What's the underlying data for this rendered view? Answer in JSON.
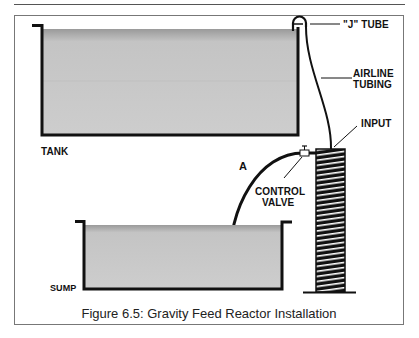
{
  "figure": {
    "caption": "Figure 6.5:  Gravity Feed Reactor Installation",
    "colors": {
      "outline": "#111111",
      "water_fill": "#c9c9c9",
      "water_top": "#9e9e9e",
      "frame": "#777777"
    }
  },
  "labels": {
    "j_tube": "\"J\" TUBE",
    "airline_line1": "AIRLINE",
    "airline_line2": "TUBING",
    "input": "INPUT",
    "tank": "TANK",
    "a": "A",
    "control_line1": "CONTROL",
    "control_line2": "VALVE",
    "sump": "SUMP"
  }
}
